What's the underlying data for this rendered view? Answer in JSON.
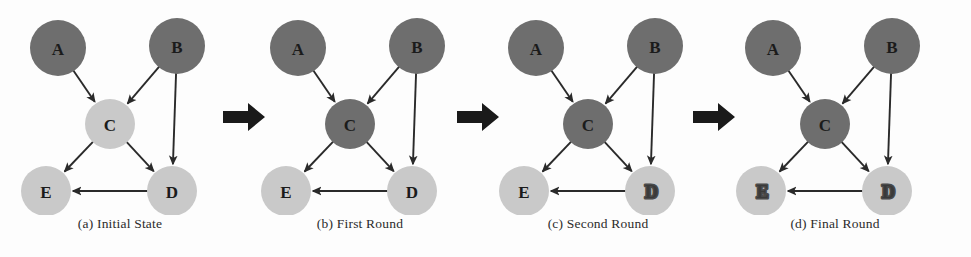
{
  "figure": {
    "colors": {
      "dark_node": "#6e6e6e",
      "light_node": "#c9c9c9",
      "edge": "#2a2a2a",
      "arrow_separator": "#1a1a1a",
      "label_text": "#1b1b1b",
      "caption_text": "#2b2b2b",
      "background": "#fdfdfd"
    },
    "node_layout": [
      {
        "id": "A",
        "cx": 58,
        "cy": 48,
        "r": 28
      },
      {
        "id": "B",
        "cx": 177,
        "cy": 46,
        "r": 28
      },
      {
        "id": "C",
        "cx": 110,
        "cy": 124,
        "r": 25
      },
      {
        "id": "E",
        "cx": 46,
        "cy": 191,
        "r": 25
      },
      {
        "id": "D",
        "cx": 172,
        "cy": 191,
        "r": 25
      }
    ],
    "edges": [
      {
        "from": "A",
        "to": "C"
      },
      {
        "from": "B",
        "to": "C"
      },
      {
        "from": "B",
        "to": "D"
      },
      {
        "from": "C",
        "to": "E"
      },
      {
        "from": "C",
        "to": "D"
      },
      {
        "from": "D",
        "to": "E"
      }
    ],
    "separators": [
      {
        "name": "separator-arrow-1",
        "x": 222
      },
      {
        "name": "separator-arrow-2",
        "x": 456
      },
      {
        "name": "separator-arrow-3",
        "x": 692
      }
    ],
    "panels": [
      {
        "key": "panel-a",
        "x": 0,
        "caption": "(a) Initial State",
        "nodes": [
          {
            "id": "A",
            "label": "A",
            "shade": "dark",
            "smudged": false
          },
          {
            "id": "B",
            "label": "B",
            "shade": "dark",
            "smudged": false
          },
          {
            "id": "C",
            "label": "C",
            "shade": "light",
            "smudged": false
          },
          {
            "id": "E",
            "label": "E",
            "shade": "light",
            "smudged": false
          },
          {
            "id": "D",
            "label": "D",
            "shade": "light",
            "smudged": false
          }
        ]
      },
      {
        "key": "panel-b",
        "x": 240,
        "caption": "(b) First Round",
        "nodes": [
          {
            "id": "A",
            "label": "A",
            "shade": "dark",
            "smudged": false
          },
          {
            "id": "B",
            "label": "B",
            "shade": "dark",
            "smudged": false
          },
          {
            "id": "C",
            "label": "C",
            "shade": "dark",
            "smudged": false
          },
          {
            "id": "E",
            "label": "E",
            "shade": "light",
            "smudged": false
          },
          {
            "id": "D",
            "label": "D",
            "shade": "light",
            "smudged": false
          }
        ]
      },
      {
        "key": "panel-c",
        "x": 478,
        "caption": "(c) Second Round",
        "nodes": [
          {
            "id": "A",
            "label": "A",
            "shade": "dark",
            "smudged": false
          },
          {
            "id": "B",
            "label": "B",
            "shade": "dark",
            "smudged": false
          },
          {
            "id": "C",
            "label": "C",
            "shade": "dark",
            "smudged": false
          },
          {
            "id": "E",
            "label": "E",
            "shade": "light",
            "smudged": false
          },
          {
            "id": "D",
            "label": "D",
            "shade": "light",
            "smudged": true
          }
        ]
      },
      {
        "key": "panel-d",
        "x": 715,
        "caption": "(d) Final Round",
        "nodes": [
          {
            "id": "A",
            "label": "A",
            "shade": "dark",
            "smudged": false
          },
          {
            "id": "B",
            "label": "B",
            "shade": "dark",
            "smudged": false
          },
          {
            "id": "C",
            "label": "C",
            "shade": "dark",
            "smudged": false
          },
          {
            "id": "E",
            "label": "E",
            "shade": "light",
            "smudged": true
          },
          {
            "id": "D",
            "label": "D",
            "shade": "light",
            "smudged": true
          }
        ]
      }
    ]
  }
}
